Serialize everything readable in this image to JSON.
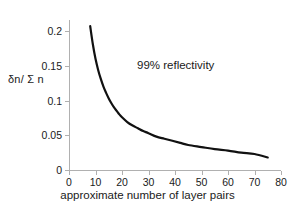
{
  "chart_data": {
    "type": "line",
    "title": "",
    "xlabel": "approximate number of layer pairs",
    "ylabel": "δn/ Σ n",
    "xlim": [
      0,
      80
    ],
    "ylim": [
      0,
      0.22
    ],
    "grid": false,
    "legend": null,
    "annotations": [
      {
        "text": "99% reflectivity",
        "x": 42,
        "y": 0.14
      }
    ],
    "xticks": [
      0,
      10,
      20,
      30,
      40,
      50,
      60,
      70,
      80
    ],
    "xtick_labels": [
      "0",
      "10",
      "20",
      "30",
      "40",
      "50",
      "60",
      "70",
      "80"
    ],
    "yticks": [
      0,
      0.05,
      0.1,
      0.15,
      0.2
    ],
    "ytick_labels": [
      "0",
      "0.05",
      "0.1",
      "0.15",
      "0.2"
    ],
    "series": [
      {
        "name": "99% reflectivity threshold",
        "color": "#111111",
        "line_width": 2.2,
        "x": [
          8,
          9,
          10,
          11,
          12,
          13,
          14,
          15,
          16,
          17,
          18,
          19,
          20,
          22,
          24,
          26,
          28,
          30,
          33,
          36,
          39,
          42,
          45,
          50,
          55,
          60,
          65,
          70,
          75
        ],
        "y": [
          0.207,
          0.181,
          0.16,
          0.144,
          0.131,
          0.12,
          0.111,
          0.103,
          0.096,
          0.09,
          0.085,
          0.08,
          0.076,
          0.069,
          0.064,
          0.06,
          0.056,
          0.053,
          0.048,
          0.045,
          0.042,
          0.039,
          0.036,
          0.033,
          0.03,
          0.028,
          0.025,
          0.023,
          0.018
        ]
      }
    ],
    "relationship": "dn/sum(n) is inversely proportional to the number of layer pairs"
  },
  "colors": {
    "background": "#ffffff",
    "axis": "#b0b0b0",
    "curve": "#111111",
    "text": "#1a1a1a"
  }
}
